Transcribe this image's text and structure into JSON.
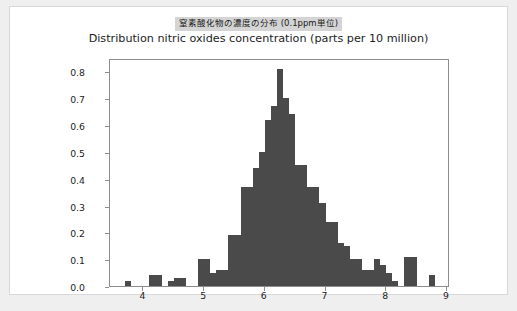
{
  "figure": {
    "title_jp": "窒素酸化物の濃度の分布 (0.1ppm単位)",
    "title_en": "Distribution nitric oxides concentration (parts per 10 million)",
    "bar_color": "#4a4a4a",
    "background_color": "#ffffff",
    "page_background_color": "#efefef",
    "title_highlight_color": "#d4d4d4",
    "axis_color": "#8d8d8d"
  },
  "chart_data": {
    "type": "bar",
    "title": "Distribution nitric oxides concentration (parts per 10 million)",
    "subtitle": "窒素酸化物の濃度の分布 (0.1ppm単位)",
    "xlabel": "",
    "ylabel": "",
    "xlim": [
      3.45,
      9.05
    ],
    "ylim": [
      0.0,
      0.85
    ],
    "xticks": [
      4,
      5,
      6,
      7,
      8,
      9
    ],
    "xtick_labels": [
      "4",
      "5",
      "6",
      "7",
      "8",
      "9"
    ],
    "yticks": [
      0.0,
      0.1,
      0.2,
      0.3,
      0.4,
      0.5,
      0.6,
      0.7,
      0.8
    ],
    "ytick_labels": [
      "0.0",
      "0.1",
      "0.2",
      "0.3",
      "0.4",
      "0.5",
      "0.6",
      "0.7",
      "0.8"
    ],
    "grid": false,
    "legend": null,
    "bin_width": 0.1,
    "x": [
      3.75,
      3.85,
      3.95,
      4.05,
      4.15,
      4.25,
      4.35,
      4.45,
      4.55,
      4.65,
      4.75,
      4.85,
      4.95,
      5.05,
      5.15,
      5.25,
      5.35,
      5.45,
      5.55,
      5.65,
      5.75,
      5.85,
      5.95,
      6.05,
      6.15,
      6.25,
      6.35,
      6.45,
      6.55,
      6.65,
      6.75,
      6.85,
      6.95,
      7.05,
      7.15,
      7.25,
      7.35,
      7.45,
      7.55,
      7.65,
      7.75,
      7.85,
      7.95,
      8.05,
      8.15,
      8.25,
      8.35,
      8.45,
      8.55,
      8.65,
      8.75
    ],
    "values": [
      0.02,
      0.0,
      0.0,
      0.0,
      0.04,
      0.04,
      0.0,
      0.02,
      0.03,
      0.03,
      0.0,
      0.0,
      0.1,
      0.1,
      0.05,
      0.06,
      0.06,
      0.19,
      0.19,
      0.37,
      0.37,
      0.44,
      0.5,
      0.62,
      0.67,
      0.81,
      0.7,
      0.64,
      0.45,
      0.45,
      0.37,
      0.37,
      0.31,
      0.24,
      0.24,
      0.16,
      0.15,
      0.1,
      0.1,
      0.06,
      0.06,
      0.1,
      0.08,
      0.05,
      0.02,
      0.0,
      0.11,
      0.11,
      0.0,
      0.0,
      0.04
    ]
  }
}
